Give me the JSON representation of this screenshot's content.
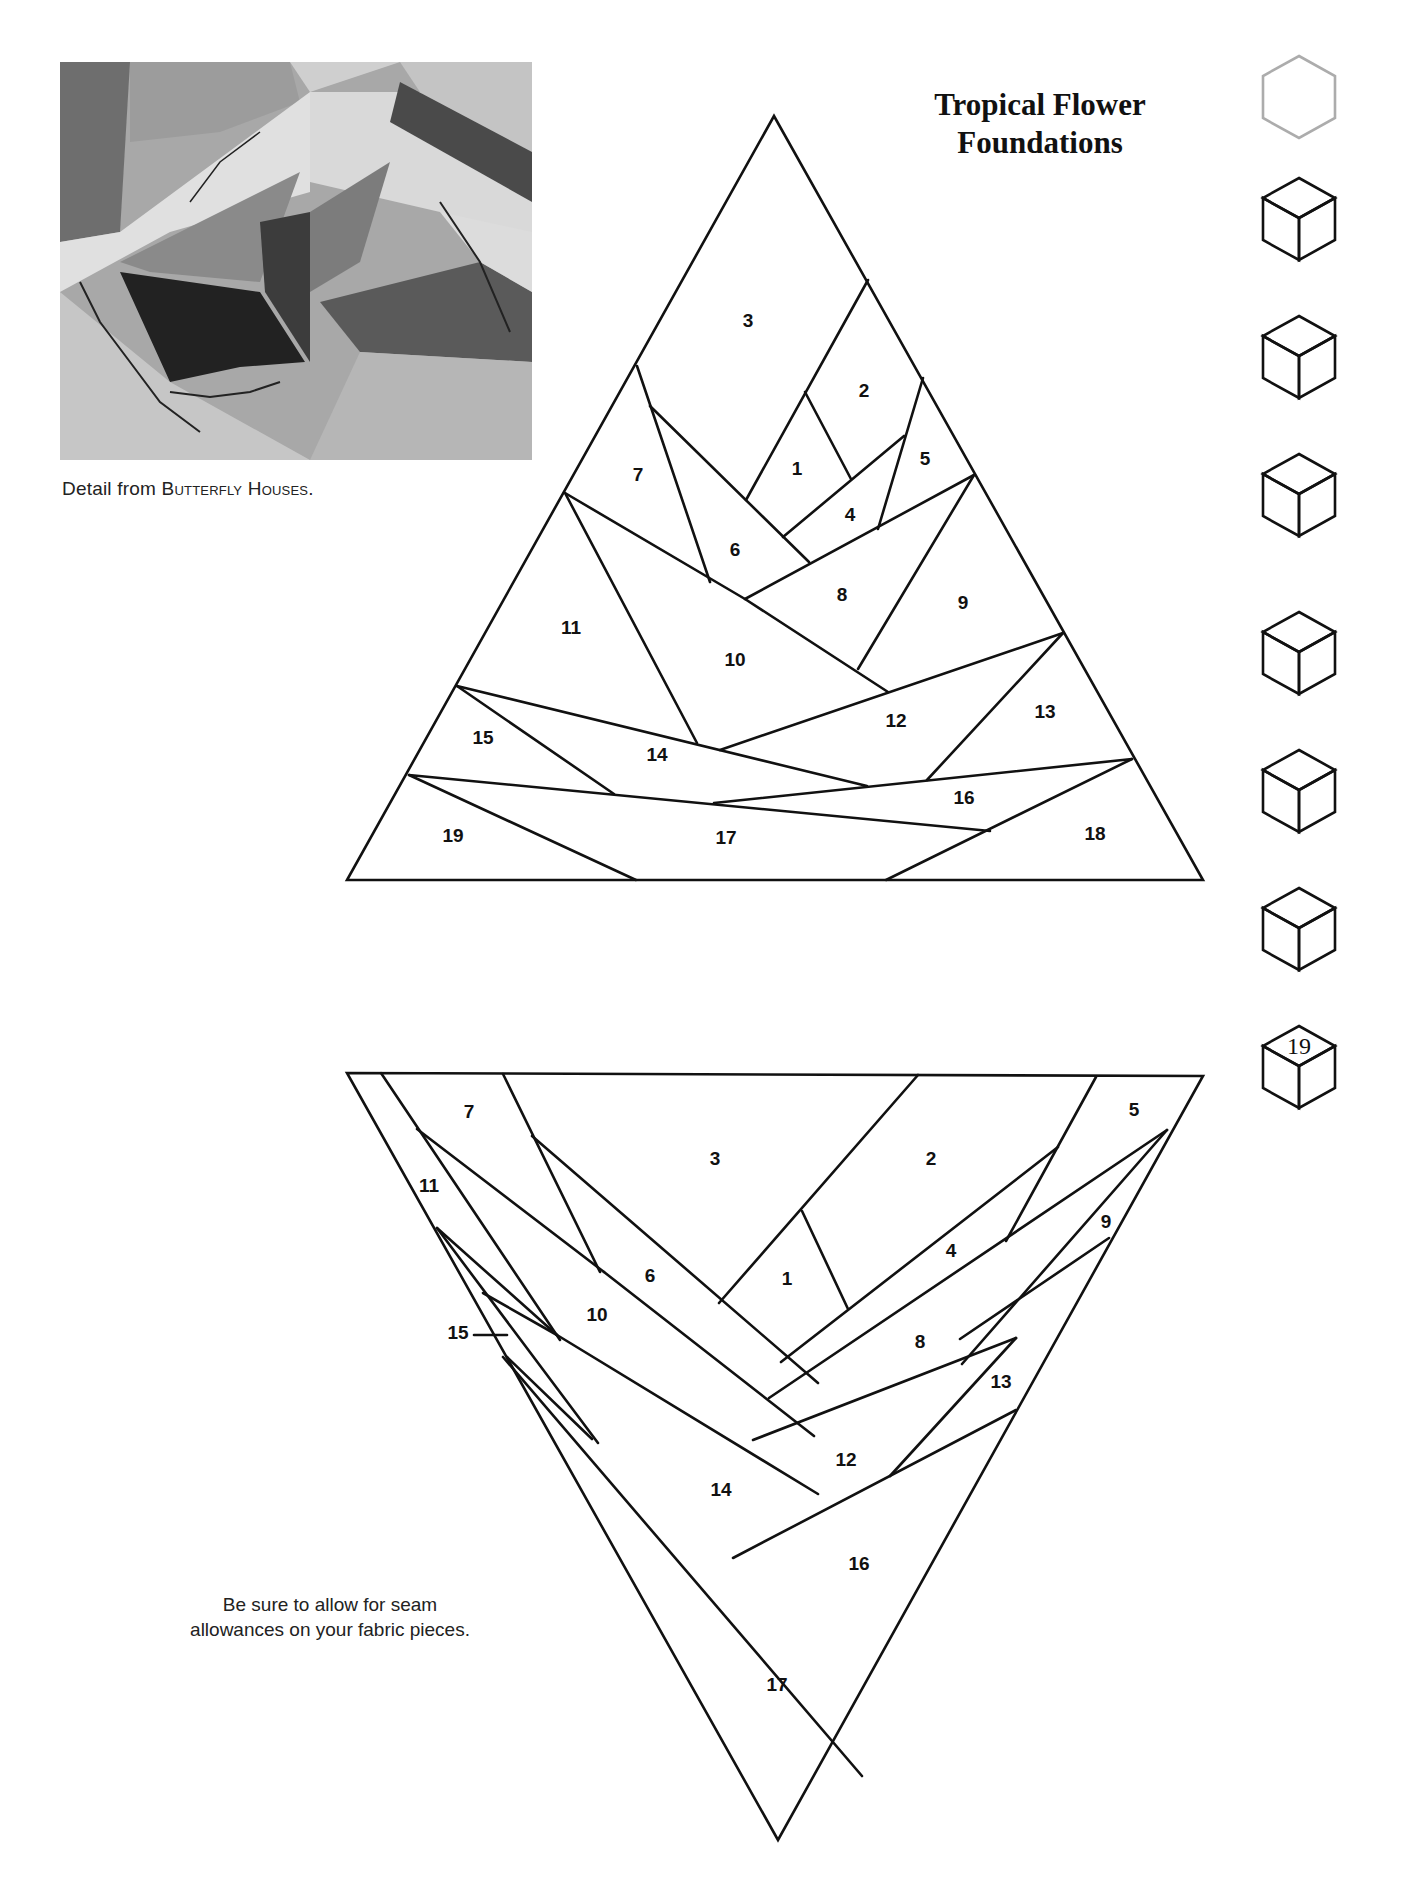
{
  "page": {
    "title_line1": "Tropical Flower",
    "title_line2": "Foundations",
    "caption_prefix": "Detail from ",
    "caption_work": "Butterfly Houses",
    "caption_suffix": ".",
    "note_line1": "Be sure to allow for seam",
    "note_line2": "allowances on your fabric pieces.",
    "chapter_tab_number": "19"
  },
  "photo": {
    "description": "Black-and-white quilt detail photo"
  },
  "top_foundation": {
    "name": "Tropical Flower foundation (upright)",
    "pieces": [
      {
        "n": "1",
        "x": 797,
        "y": 470
      },
      {
        "n": "2",
        "x": 864,
        "y": 392
      },
      {
        "n": "3",
        "x": 748,
        "y": 322
      },
      {
        "n": "4",
        "x": 850,
        "y": 516
      },
      {
        "n": "5",
        "x": 925,
        "y": 460
      },
      {
        "n": "6",
        "x": 735,
        "y": 551
      },
      {
        "n": "7",
        "x": 638,
        "y": 476
      },
      {
        "n": "8",
        "x": 842,
        "y": 596
      },
      {
        "n": "9",
        "x": 963,
        "y": 604
      },
      {
        "n": "10",
        "x": 735,
        "y": 661
      },
      {
        "n": "11",
        "x": 571,
        "y": 629
      },
      {
        "n": "12",
        "x": 896,
        "y": 722
      },
      {
        "n": "13",
        "x": 1045,
        "y": 713
      },
      {
        "n": "14",
        "x": 657,
        "y": 756
      },
      {
        "n": "15",
        "x": 483,
        "y": 739
      },
      {
        "n": "16",
        "x": 964,
        "y": 799
      },
      {
        "n": "17",
        "x": 726,
        "y": 839
      },
      {
        "n": "18",
        "x": 1095,
        "y": 835
      },
      {
        "n": "19",
        "x": 453,
        "y": 837
      }
    ]
  },
  "bottom_foundation": {
    "name": "Tropical Flower foundation (inverted)",
    "pieces": [
      {
        "n": "1",
        "x": 787,
        "y": 1280
      },
      {
        "n": "2",
        "x": 931,
        "y": 1160
      },
      {
        "n": "3",
        "x": 715,
        "y": 1160
      },
      {
        "n": "4",
        "x": 951,
        "y": 1252
      },
      {
        "n": "5",
        "x": 1134,
        "y": 1111
      },
      {
        "n": "6",
        "x": 650,
        "y": 1277
      },
      {
        "n": "7",
        "x": 469,
        "y": 1113
      },
      {
        "n": "8",
        "x": 920,
        "y": 1343
      },
      {
        "n": "9",
        "x": 1106,
        "y": 1223
      },
      {
        "n": "10",
        "x": 597,
        "y": 1316
      },
      {
        "n": "11",
        "x": 429,
        "y": 1187
      },
      {
        "n": "12",
        "x": 846,
        "y": 1461
      },
      {
        "n": "13",
        "x": 1001,
        "y": 1383
      },
      {
        "n": "14",
        "x": 721,
        "y": 1491
      },
      {
        "n": "15",
        "x": 458,
        "y": 1334
      },
      {
        "n": "16",
        "x": 859,
        "y": 1565
      },
      {
        "n": "17",
        "x": 777,
        "y": 1686
      }
    ]
  },
  "side_tabs": [
    {
      "index": 1,
      "shade": "#f4f4f4",
      "label": ""
    },
    {
      "index": 2,
      "shade": "#ececec",
      "label": ""
    },
    {
      "index": 3,
      "shade": "#e2e2e2",
      "label": ""
    },
    {
      "index": 4,
      "shade": "#d6d6d6",
      "label": ""
    },
    {
      "index": 5,
      "shade": "#cbcbcb",
      "label": ""
    },
    {
      "index": 6,
      "shade": "#bfbfbf",
      "label": ""
    },
    {
      "index": 7,
      "shade": "#b3b3b3",
      "label": ""
    },
    {
      "index": 8,
      "shade": "#a8a8a8",
      "label": "19"
    }
  ]
}
